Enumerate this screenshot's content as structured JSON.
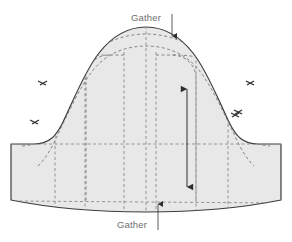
{
  "diagram": {
    "type": "sewing-pattern-schematic",
    "background_color": "#ffffff",
    "piece": {
      "fill_color": "#e8e8e8",
      "outline_color": "#3d3d3d",
      "outline_width": 1.2,
      "description": "Dome shaped bonnet / sleeve cap pattern with straight side edges and slightly curved hem"
    },
    "stitch_lines": {
      "color": "#7a7a7a",
      "style": "dashed",
      "dash": "3,2.5",
      "width": 0.9
    },
    "grid_lines": {
      "color": "#8a8a8a",
      "style": "dashed",
      "dash": "3,2.5",
      "width": 0.9
    },
    "grainline": {
      "color": "#3d3d3d",
      "label": "",
      "orientation": "vertical",
      "double_headed": true
    },
    "notches": {
      "color": "#2e2e2e",
      "left_count": 2,
      "right_count": 2
    },
    "labels": {
      "top": {
        "text": "Gather",
        "color": "#6e6e6e",
        "leader_direction": "down"
      },
      "bottom": {
        "text": "Gather",
        "color": "#6e6e6e",
        "leader_direction": "up"
      }
    }
  }
}
